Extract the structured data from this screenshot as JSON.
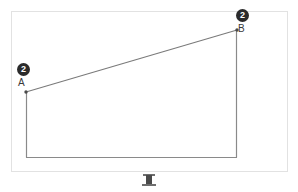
{
  "figure": {
    "outer_frame": {
      "name": "diagram-border",
      "color": "#e2e2e2"
    },
    "stroke_color": "#7a7a7a",
    "points": [
      {
        "id": "A",
        "label": "A",
        "badge": "2",
        "x": 26,
        "y": 92
      },
      {
        "id": "B",
        "label": "B",
        "badge": "2",
        "x": 237,
        "y": 30
      }
    ],
    "badge_color": "#2b2b2b",
    "badge_text_color": "#ffffff",
    "shapes": {
      "diagonal_line": "A-B",
      "left_vertical": "A to baseline",
      "right_vertical": "B to baseline",
      "baseline": "horizontal bottom edge"
    },
    "baseline_y": 157,
    "bottom_glyph": {
      "name": "ibeam-glyph",
      "label": "I"
    }
  }
}
